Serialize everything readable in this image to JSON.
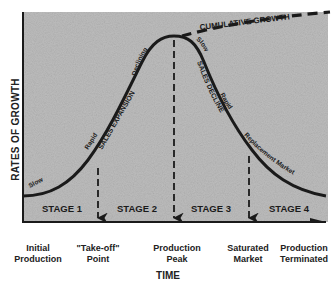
{
  "diagram": {
    "y_axis_label": "RATES OF GROWTH",
    "x_axis_label": "TIME",
    "stages": [
      {
        "label": "STAGE 1"
      },
      {
        "label": "STAGE 2"
      },
      {
        "label": "STAGE 3"
      },
      {
        "label": "STAGE 4"
      }
    ],
    "milestones": [
      {
        "line1": "Initial",
        "line2": "Production"
      },
      {
        "line1": "\"Take-off\"",
        "line2": "Point"
      },
      {
        "line1": "Production",
        "line2": "Peak"
      },
      {
        "line1": "Saturated",
        "line2": "Market"
      },
      {
        "line1": "Production",
        "line2": "Terminated"
      }
    ],
    "curve_annotations": {
      "slow_start": "Slow",
      "rapid_rise": "Rapid",
      "sales_expansion": "SALES EXPANSION",
      "declining": "Declining",
      "slow_top": "Slow",
      "rapid_fall": "Rapid",
      "sales_decline": "SALES DECLINE",
      "replacement_market": "Replacement Market"
    },
    "cumulative_label": "CUMULATIVE GROWTH",
    "colors": {
      "background": "#b9b9b9",
      "curve": "#1a1a1a",
      "text": "#222222"
    }
  }
}
